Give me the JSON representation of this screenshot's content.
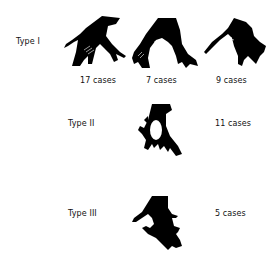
{
  "diagram": {
    "rows": [
      {
        "type_label": "Type I",
        "variants": [
          {
            "cases": "17 cases"
          },
          {
            "cases": "7 cases"
          },
          {
            "cases": "9 cases"
          }
        ]
      },
      {
        "type_label": "Type II",
        "variants": [
          {
            "cases": "11 cases"
          }
        ]
      },
      {
        "type_label": "Type III",
        "variants": [
          {
            "cases": "5 cases"
          }
        ]
      }
    ],
    "colors": {
      "shape_fill": "#000000",
      "background": "#ffffff",
      "text": "#111111"
    }
  }
}
